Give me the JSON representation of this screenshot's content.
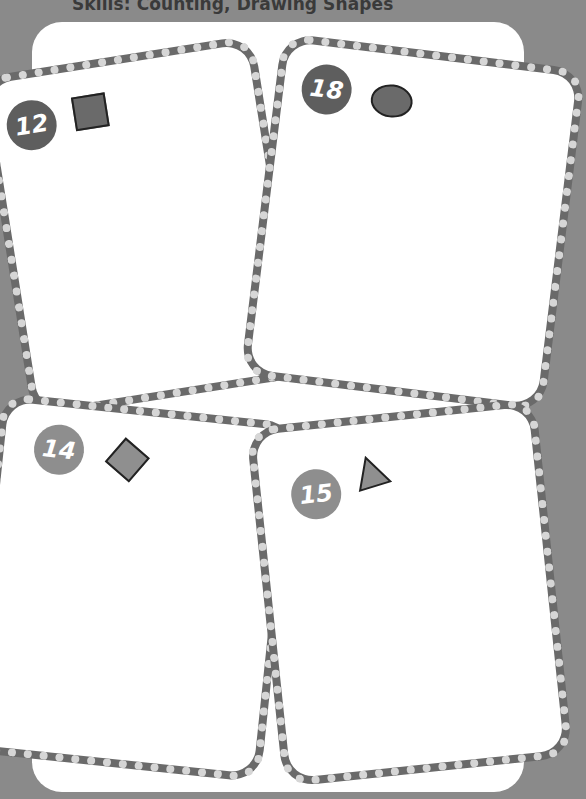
{
  "header": {
    "skills_text": "Skills: Counting, Drawing Shapes"
  },
  "cards": [
    {
      "number": "12",
      "shape": "square",
      "shape_icon": "square-icon",
      "badge_tone": "dark"
    },
    {
      "number": "18",
      "shape": "oval",
      "shape_icon": "oval-icon",
      "badge_tone": "dark"
    },
    {
      "number": "14",
      "shape": "diamond",
      "shape_icon": "diamond-icon",
      "badge_tone": "light"
    },
    {
      "number": "15",
      "shape": "triangle",
      "shape_icon": "triangle-icon",
      "badge_tone": "light"
    }
  ],
  "colors": {
    "page_background": "#8a8a8a",
    "panel": "#ffffff",
    "border_dark": "#6a6a6a",
    "border_dots": "#d6d6d6",
    "badge_dark": "#5e5e5e",
    "badge_light": "#8e8e8e",
    "shape_fill_dark": "#6a6a6a",
    "shape_fill_light": "#8f8f8f"
  }
}
